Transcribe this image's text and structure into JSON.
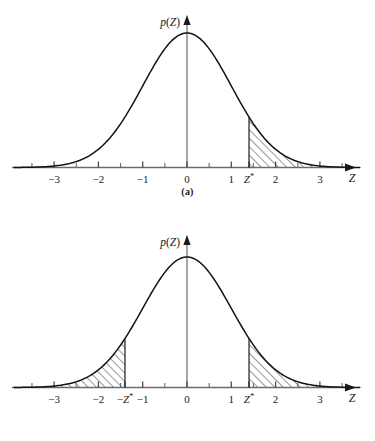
{
  "figure": {
    "background": "#ffffff",
    "line_color": "#1a1a1a",
    "axis_color": "#555555",
    "hatch_color": "#1a1a1a"
  },
  "panels": [
    {
      "id": "a",
      "caption": "(a)",
      "ylabel_func": "p",
      "ylabel_open": "(",
      "ylabel_var": "Z",
      "ylabel_close": ")",
      "xlabel": "Z",
      "tick_labels": [
        "−3",
        "−2",
        "−1",
        "0",
        "1",
        "Z*",
        "2",
        "3"
      ],
      "tick_values": [
        -3,
        -2,
        -1,
        0,
        1,
        1.4,
        2,
        3
      ],
      "minor_tick_values": [
        -3.5,
        -2.5,
        -1.5,
        -0.5,
        0.5,
        1.5,
        2.5,
        3.5
      ],
      "shaded_regions": [
        {
          "name": "upper-tail",
          "from": 1.4,
          "to": 3.7,
          "label": "Z*"
        }
      ]
    },
    {
      "id": "b",
      "caption": "(b)",
      "ylabel_func": "p",
      "ylabel_open": "(",
      "ylabel_var": "Z",
      "ylabel_close": ")",
      "xlabel": "Z",
      "tick_labels": [
        "−3",
        "−2",
        "−Z*",
        "−1",
        "0",
        "1",
        "Z*",
        "2",
        "3"
      ],
      "tick_values": [
        -3,
        -2,
        -1.4,
        -1,
        0,
        1,
        1.4,
        2,
        3
      ],
      "minor_tick_values": [
        -3.5,
        -2.5,
        -1.5,
        -0.5,
        0.5,
        1.5,
        2.5,
        3.5
      ],
      "shaded_regions": [
        {
          "name": "lower-tail",
          "from": -3.7,
          "to": -1.4,
          "label": "−Z*"
        },
        {
          "name": "upper-tail",
          "from": 1.4,
          "to": 3.7,
          "label": "Z*"
        }
      ]
    }
  ],
  "chart_data": {
    "type": "line",
    "title": "",
    "xlabel": "Z",
    "ylabel": "p(Z)",
    "xlim": [
      -3.9,
      3.9
    ],
    "ylim": [
      0,
      0.42
    ],
    "grid": false,
    "legend": "none",
    "curve": "standard normal density p(Z) = (1/sqrt(2*pi)) * exp(-Z^2/2)",
    "x": [
      -3.9,
      -3.6,
      -3.3,
      -3.0,
      -2.7,
      -2.4,
      -2.1,
      -1.8,
      -1.5,
      -1.2,
      -0.9,
      -0.6,
      -0.3,
      0.0,
      0.3,
      0.6,
      0.9,
      1.2,
      1.5,
      1.8,
      2.1,
      2.4,
      2.7,
      3.0,
      3.3,
      3.6,
      3.9
    ],
    "y": [
      0.0002,
      0.0006,
      0.0017,
      0.0044,
      0.0104,
      0.0224,
      0.044,
      0.079,
      0.1295,
      0.1942,
      0.2661,
      0.3332,
      0.3814,
      0.3989,
      0.3814,
      0.3332,
      0.2661,
      0.1942,
      0.1295,
      0.079,
      0.044,
      0.0224,
      0.0104,
      0.0044,
      0.0017,
      0.0006,
      0.0002
    ],
    "panels": [
      {
        "name": "(a) one-tailed",
        "shaded": [
          {
            "from": 1.4,
            "to": 3.9
          }
        ],
        "critical_values": [
          {
            "label": "Z*",
            "value": 1.4
          }
        ]
      },
      {
        "name": "(b) two-tailed",
        "shaded": [
          {
            "from": -3.9,
            "to": -1.4
          },
          {
            "from": 1.4,
            "to": 3.9
          }
        ],
        "critical_values": [
          {
            "label": "−Z*",
            "value": -1.4
          },
          {
            "label": "Z*",
            "value": 1.4
          }
        ]
      }
    ]
  }
}
